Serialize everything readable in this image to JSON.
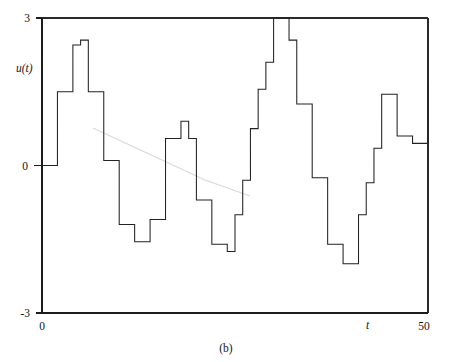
{
  "figure": {
    "caption": "(b)"
  },
  "chart_data": {
    "type": "line",
    "subtype": "step-post",
    "title": "",
    "subtitle": "",
    "xlabel": "t",
    "ylabel": "u(t)",
    "xlim": [
      0,
      50
    ],
    "ylim": [
      -3,
      3
    ],
    "grid": false,
    "legend": null,
    "x_ticks": [
      0,
      50
    ],
    "x_tick_labels": [
      "0",
      "50"
    ],
    "y_ticks": [
      -3,
      0,
      3
    ],
    "y_tick_labels": [
      "-3",
      "0",
      "3"
    ],
    "annotations": [
      "(b)"
    ],
    "series": [
      {
        "name": "u(t)",
        "color": "#222222",
        "x": [
          0,
          1,
          2,
          3,
          4,
          5,
          6,
          7,
          8,
          9,
          10,
          11,
          12,
          13,
          14,
          15,
          16,
          17,
          18,
          19,
          20,
          21,
          22,
          23,
          24,
          25,
          26,
          27,
          28,
          29,
          30,
          31,
          32,
          33,
          34,
          35,
          36,
          37,
          38,
          39,
          40,
          41,
          42,
          43,
          44,
          45,
          46,
          47,
          48,
          49,
          50
        ],
        "values": [
          0.0,
          0.0,
          1.5,
          1.5,
          2.45,
          2.55,
          1.5,
          1.5,
          0.1,
          0.1,
          -1.2,
          -1.2,
          -1.55,
          -1.55,
          -1.1,
          -1.1,
          0.55,
          0.55,
          0.9,
          0.55,
          -0.7,
          -0.7,
          -1.6,
          -1.6,
          -1.75,
          -1.0,
          -0.3,
          0.75,
          1.55,
          2.1,
          3.0,
          3.0,
          2.55,
          1.25,
          1.25,
          -0.25,
          -0.25,
          -1.6,
          -1.6,
          -2.0,
          -2.0,
          -1.0,
          -0.35,
          0.35,
          1.45,
          1.45,
          0.6,
          0.6,
          0.45,
          0.45,
          1.6
        ]
      }
    ]
  }
}
